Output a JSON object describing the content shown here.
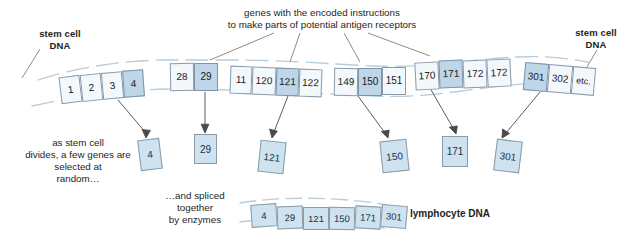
{
  "diagram": {
    "title_note": "V(D)J gene recombination diagram",
    "colors": {
      "gene_fill": "#f2f8fc",
      "gene_selected_fill": "#bed6e8",
      "card_fill": "#cfe2ef",
      "stroke": "#8d9aa6",
      "text": "#231f20",
      "strand_line": "#b8ccd9"
    }
  },
  "labels": {
    "stem_cell_dna_left": "stem cell\nDNA",
    "stem_cell_dna_right": "stem cell\nDNA",
    "top_note": "genes with the encoded instructions\nto make parts of potential antigen receptors",
    "left_note": "as stem cell\ndivides, a few genes are\nselected at\nrandom…",
    "splice_note": "…and spliced\ntogether\nby enzymes",
    "lymphocyte_dna": "lymphocyte DNA"
  },
  "stem_cell_strand": {
    "groups": [
      {
        "name": "group-1",
        "genes": [
          {
            "label": "1",
            "selected": false
          },
          {
            "label": "2",
            "selected": false
          },
          {
            "label": "3",
            "selected": false
          },
          {
            "label": "4",
            "selected": true
          }
        ]
      },
      {
        "name": "group-2",
        "genes": [
          {
            "label": "28",
            "selected": false
          },
          {
            "label": "29",
            "selected": true
          }
        ]
      },
      {
        "name": "group-3",
        "genes": [
          {
            "label": "11",
            "selected": false
          },
          {
            "label": "120",
            "selected": false
          },
          {
            "label": "121",
            "selected": true
          },
          {
            "label": "122",
            "selected": false
          }
        ]
      },
      {
        "name": "group-4",
        "genes": [
          {
            "label": "149",
            "selected": false
          },
          {
            "label": "150",
            "selected": true
          },
          {
            "label": "151",
            "selected": false
          }
        ]
      },
      {
        "name": "group-5",
        "genes": [
          {
            "label": "170",
            "selected": false
          },
          {
            "label": "171",
            "selected": true
          },
          {
            "label": "172",
            "selected": false
          },
          {
            "label": "172",
            "selected": false
          }
        ]
      },
      {
        "name": "group-6",
        "genes": [
          {
            "label": "301",
            "selected": true
          },
          {
            "label": "302",
            "selected": false
          },
          {
            "label": "etc.",
            "selected": false
          }
        ]
      }
    ]
  },
  "selected_cards": [
    {
      "label": "4"
    },
    {
      "label": "29"
    },
    {
      "label": "121"
    },
    {
      "label": "150"
    },
    {
      "label": "171"
    },
    {
      "label": "301"
    }
  ],
  "lymphocyte_strand": {
    "genes": [
      {
        "label": "4"
      },
      {
        "label": "29"
      },
      {
        "label": "121"
      },
      {
        "label": "150"
      },
      {
        "label": "171"
      },
      {
        "label": "301"
      }
    ]
  }
}
